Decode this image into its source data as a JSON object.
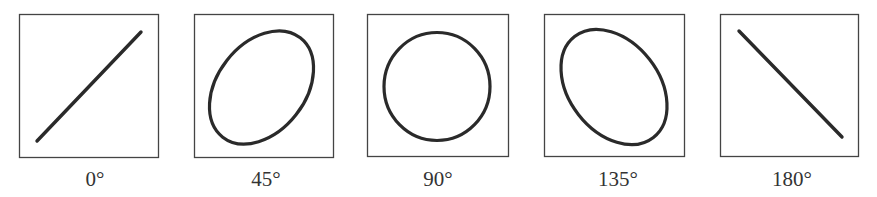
{
  "diagram": {
    "panels": [
      {
        "label": "0°",
        "shape": "line-rising"
      },
      {
        "label": "45°",
        "shape": "ellipse-tilted-right"
      },
      {
        "label": "90°",
        "shape": "circle"
      },
      {
        "label": "135°",
        "shape": "ellipse-tilted-left"
      },
      {
        "label": "180°",
        "shape": "line-falling"
      }
    ],
    "colors": {
      "stroke": "#2a2a2a",
      "frame": "#444444",
      "label": "#333333"
    }
  }
}
